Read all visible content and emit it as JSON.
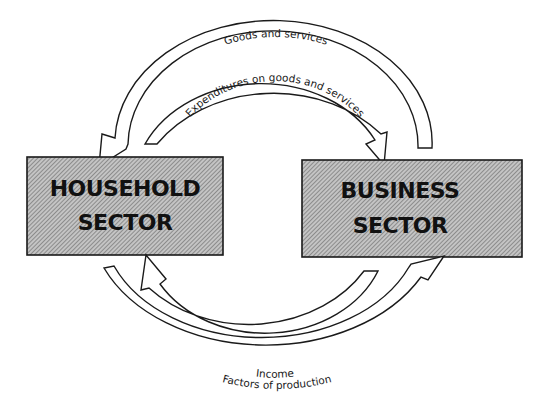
{
  "diagram": {
    "sectors": {
      "household": {
        "line1": "HOUSEHOLD",
        "line2": "SECTOR"
      },
      "business": {
        "line1": "BUSINESS",
        "line2": "SECTOR"
      }
    },
    "flows": {
      "goods_and_services": {
        "label": "Goods and services",
        "from": "business",
        "to": "household"
      },
      "expenditures": {
        "label": "Expenditures on goods and services",
        "from": "household",
        "to": "business"
      },
      "income": {
        "label": "Income",
        "from": "business",
        "to": "household"
      },
      "factors": {
        "label": "Factors of production",
        "from": "household",
        "to": "business"
      }
    },
    "colors": {
      "box_fill": "#bdbdbd",
      "hatch_line": "#7a7a7a",
      "stroke": "#1a1a1a",
      "arrow_fill": "#ffffff"
    }
  }
}
